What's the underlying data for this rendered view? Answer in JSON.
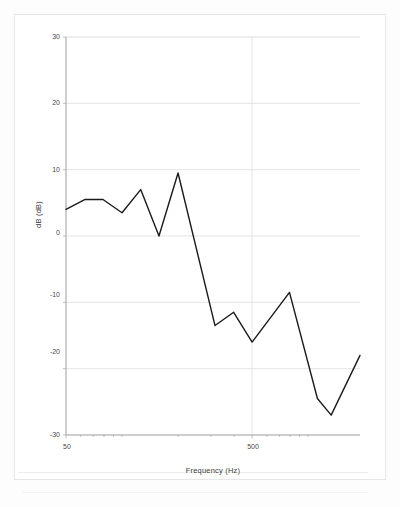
{
  "figure": {
    "kind": "line-chart",
    "frame_color": "#e7e7e7",
    "plot_border_color": "#9a9a9a",
    "gridline_color": "#d8d8d8",
    "series_color": "#1a1a1a"
  },
  "axes": {
    "y": {
      "title": "dB (dB)",
      "ticks": [
        "30",
        "20",
        "10",
        "0",
        "-10",
        "-20",
        "-30"
      ],
      "tick_values": [
        30,
        20,
        10,
        0,
        -10,
        -20,
        -30
      ],
      "min": -30,
      "max": 30
    },
    "x": {
      "title": "Frequency (Hz)",
      "ticks": [
        "50",
        "500"
      ],
      "tick_values": [
        50,
        500
      ],
      "min": 50,
      "max": 1900,
      "scale": "log"
    }
  },
  "chart_data": {
    "type": "line",
    "title": "",
    "subtitle": "",
    "xlabel": "Frequency (Hz)",
    "ylabel": "dB (dB)",
    "xscale": "log",
    "yscale": "linear",
    "xlim": [
      50,
      1900
    ],
    "ylim": [
      -30,
      30
    ],
    "grid": true,
    "legend": "none",
    "yticks": [
      30,
      20,
      10,
      0,
      -10,
      -20,
      -30
    ],
    "xticks": [
      50,
      500
    ],
    "series": [
      {
        "name": "dB",
        "color": "#1a1a1a",
        "x": [
          50,
          63,
          79,
          100,
          126,
          158,
          200,
          316,
          398,
          500,
          794,
          1122,
          1330,
          1900
        ],
        "y": [
          4.0,
          5.5,
          5.5,
          3.5,
          7.0,
          0.0,
          9.5,
          -13.5,
          -11.5,
          -16.0,
          -8.5,
          -24.5,
          -27.0,
          -18.0
        ]
      }
    ]
  }
}
